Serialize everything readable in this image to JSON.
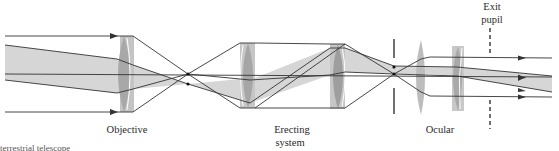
{
  "diagram": {
    "labels": {
      "objective": "Objective",
      "erecting_line1": "Erecting",
      "erecting_line2": "system",
      "ocular": "Ocular",
      "exit_line1": "Exit",
      "exit_line2": "pupil",
      "caption_fragment": "terrestrial telescope"
    },
    "components": [
      {
        "name": "Objective",
        "type": "lens",
        "x": 124
      },
      {
        "name": "Erecting system lens 1",
        "type": "lens",
        "x": 248
      },
      {
        "name": "Erecting system lens 2",
        "type": "lens",
        "x": 338
      },
      {
        "name": "Field stop",
        "type": "aperture",
        "x": 394
      },
      {
        "name": "Ocular field lens",
        "type": "lens",
        "x": 421
      },
      {
        "name": "Ocular eye lens",
        "type": "lens",
        "x": 457
      },
      {
        "name": "Exit pupil",
        "type": "dashed-plane",
        "x": 490
      }
    ],
    "colors": {
      "ray": "#333333",
      "beam_fill": "#d4d4d4",
      "lens_fill": "#b5b5b5",
      "lens_dark": "#9a9a9a",
      "text": "#2a2a2a"
    }
  }
}
